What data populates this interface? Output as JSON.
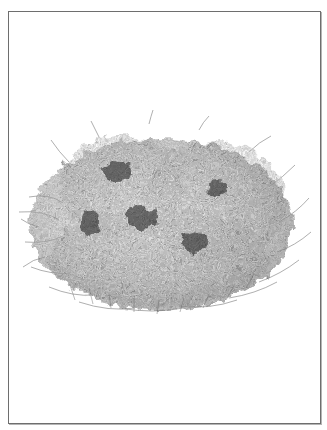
{
  "image": {
    "subject": "Illustration of a dense, rounded flowering shrub (heather-like bush) on a white background",
    "style": "grayscale stipple / pen illustration",
    "frame": {
      "border_color": "#6e6e6e",
      "shadow_color": "#b5b5b5",
      "background": "#ffffff"
    },
    "palette": {
      "foliage_dark": "#2a2a2a",
      "foliage_mid": "#6a6a6a",
      "foliage_light": "#a8a8a8",
      "branch": "#555555"
    },
    "shrub_bounds": {
      "left": 14,
      "top": 112,
      "right": 300,
      "bottom": 308
    }
  }
}
